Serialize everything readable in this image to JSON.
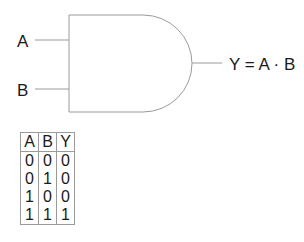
{
  "diagram": {
    "type": "AND gate",
    "inputs": [
      {
        "label": "A"
      },
      {
        "label": "B"
      }
    ],
    "output": {
      "label": "Y = A · B"
    },
    "colors": {
      "stroke": "#9a9a9a",
      "text": "#1a1a1a"
    }
  },
  "truth_table": {
    "headers": [
      "A",
      "B",
      "Y"
    ],
    "rows": [
      [
        "0",
        "0",
        "0"
      ],
      [
        "0",
        "1",
        "0"
      ],
      [
        "1",
        "0",
        "0"
      ],
      [
        "1",
        "1",
        "1"
      ]
    ]
  }
}
